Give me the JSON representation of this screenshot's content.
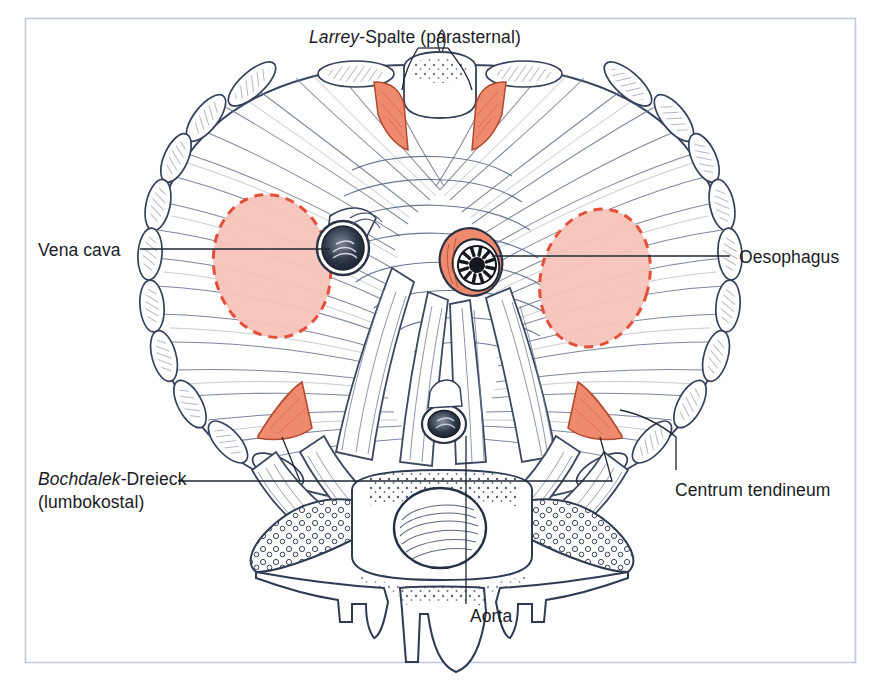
{
  "figure": {
    "title_context": "Anatomical illustration of the diaphragm viewed from above (abdominal surface)",
    "frame_color": "#c2c8de",
    "background_color": "#ffffff",
    "ink_color": "#33405c",
    "accent_weak_area_fill": "#f7c3b8",
    "accent_weak_area_stroke": "#e2503a",
    "accent_muscle_fill": "#ee8a6e",
    "text_color": "#1a1a26"
  },
  "labels": {
    "larrey": {
      "line1_italic": "Larrey",
      "line1_rest": "-Spalte (parasternal)",
      "plain": "Larrey-Spalte (parasternal)"
    },
    "vena_cava": {
      "text": "Vena cava"
    },
    "oesophagus": {
      "text": "Oesophagus"
    },
    "bochdalek": {
      "line1_italic": "Bochdalek",
      "line1_rest": "-Dreieck",
      "line2": "(lumbokostal)",
      "plain": "Bochdalek-Dreieck (lumbokostal)"
    },
    "centrum_tendineum": {
      "text": "Centrum tendineum"
    },
    "aorta": {
      "text": "Aorta"
    }
  },
  "structures": [
    {
      "name": "larrey-gap-left",
      "kind": "weak-area",
      "color": "#ee8a6e"
    },
    {
      "name": "larrey-gap-right",
      "kind": "weak-area",
      "color": "#ee8a6e"
    },
    {
      "name": "vena-cava-foramen",
      "kind": "opening",
      "color": "#2b3347"
    },
    {
      "name": "oesophageal-hiatus",
      "kind": "opening",
      "color": "#ee8a6e"
    },
    {
      "name": "aortic-hiatus",
      "kind": "opening",
      "color": "#2b3347"
    },
    {
      "name": "centrum-tendineum-left-lobe",
      "kind": "tendon-field",
      "color": "#f7c3b8"
    },
    {
      "name": "centrum-tendineum-right-lobe",
      "kind": "tendon-field",
      "color": "#f7c3b8"
    },
    {
      "name": "bochdalek-triangle-left",
      "kind": "weak-area",
      "color": "#ee8a6e"
    },
    {
      "name": "bochdalek-triangle-right",
      "kind": "weak-area",
      "color": "#ee8a6e"
    },
    {
      "name": "vertebral-body",
      "kind": "bone",
      "color": "#ffffff"
    },
    {
      "name": "rib-cross-sections",
      "kind": "bone",
      "color": "#ffffff"
    }
  ]
}
